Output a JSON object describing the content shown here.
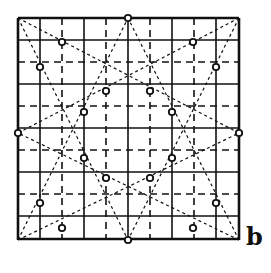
{
  "figure": {
    "label": "b",
    "type": "geometric grid construction with eight-point star",
    "colors": {
      "line": "#111111",
      "background": "#ffffff"
    },
    "square": {
      "x0": 18,
      "y0": 18,
      "x1": 239,
      "y1": 240
    },
    "grid": {
      "positions": [
        18,
        40,
        62,
        84,
        106,
        128,
        150,
        172,
        194,
        216,
        239
      ],
      "styles": [
        "solid",
        "solid",
        "dashed",
        "solid",
        "dashed",
        "solid",
        "dashed",
        "solid",
        "dashed",
        "solid",
        "solid"
      ]
    },
    "star_lines": [
      [
        18,
        18,
        239,
        133
      ],
      [
        18,
        18,
        128,
        240
      ],
      [
        239,
        18,
        18,
        133
      ],
      [
        239,
        18,
        128,
        240
      ],
      [
        18,
        240,
        128,
        18
      ],
      [
        18,
        240,
        239,
        133
      ],
      [
        239,
        240,
        128,
        18
      ],
      [
        239,
        240,
        18,
        133
      ]
    ],
    "circles": [
      [
        128,
        18
      ],
      [
        18,
        133
      ],
      [
        128,
        240
      ],
      [
        239,
        133
      ],
      [
        62,
        42
      ],
      [
        193,
        42
      ],
      [
        40,
        67
      ],
      [
        216,
        67
      ],
      [
        106,
        91
      ],
      [
        150,
        91
      ],
      [
        84,
        112
      ],
      [
        172,
        112
      ],
      [
        84,
        158
      ],
      [
        172,
        158
      ],
      [
        106,
        178
      ],
      [
        150,
        178
      ],
      [
        40,
        203
      ],
      [
        216,
        203
      ],
      [
        62,
        228
      ],
      [
        193,
        228
      ]
    ]
  }
}
